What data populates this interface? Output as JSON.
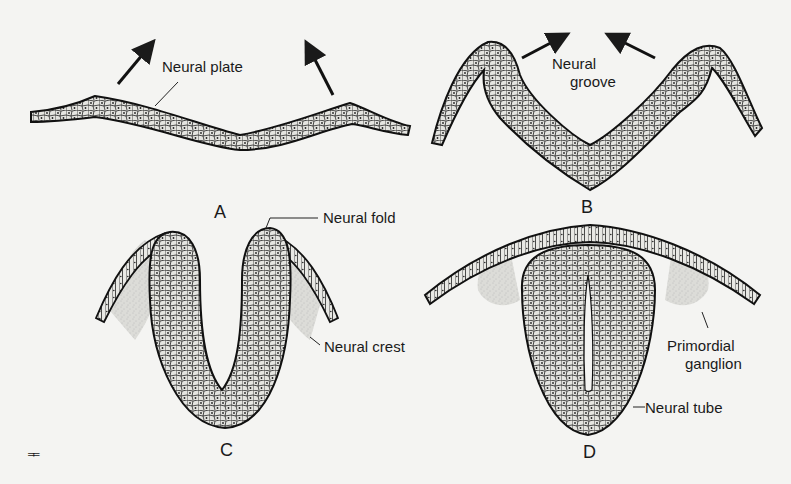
{
  "figure": {
    "panels": [
      {
        "id": "A",
        "label": "A",
        "callouts": [
          "Neural plate"
        ]
      },
      {
        "id": "B",
        "label": "B",
        "callouts": [
          "Neural groove"
        ]
      },
      {
        "id": "C",
        "label": "C",
        "callouts": [
          "Neural fold",
          "Neural crest"
        ]
      },
      {
        "id": "D",
        "label": "D",
        "callouts": [
          "Primordial ganglion",
          "Neural tube"
        ]
      }
    ],
    "labels": {
      "neural_plate": "Neural plate",
      "neural_groove_1": "Neural",
      "neural_groove_2": "groove",
      "neural_fold": "Neural fold",
      "neural_crest": "Neural crest",
      "primordial_ganglion_1": "Primordial",
      "primordial_ganglion_2": "ganglion",
      "neural_tube": "Neural tube",
      "panel_a": "A",
      "panel_b": "B",
      "panel_c": "C",
      "panel_d": "D",
      "corner_mark": "ᆍ"
    },
    "colors": {
      "ink": "#1a1a1a",
      "paper": "#f4f4f2",
      "cell_fill": "#e4e4e0",
      "crest_stipple": "#cfcfcb"
    }
  }
}
